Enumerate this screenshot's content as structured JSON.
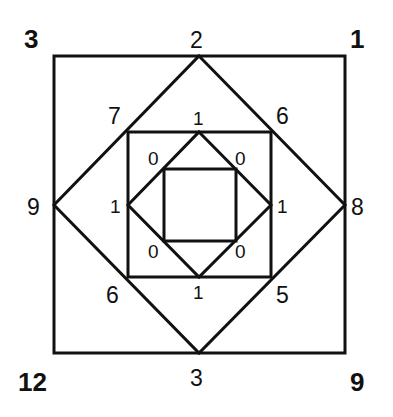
{
  "corner_labels": {
    "top_left": "3",
    "top_right": "1",
    "bottom_left": "12",
    "bottom_right": "9"
  },
  "outer_diamond_labels": {
    "top": "2",
    "right": "8",
    "bottom": "3",
    "left": "9"
  },
  "middle_square_corner_labels": {
    "top_left": "7",
    "top_right": "6",
    "bottom_left": "6",
    "bottom_right": "5"
  },
  "inner_diamond_labels": {
    "top": "1",
    "right": "1",
    "bottom": "1",
    "left": "1"
  },
  "inner_square_corner_labels": {
    "top_left": "0",
    "top_right": "0",
    "bottom_left": "0",
    "bottom_right": "0"
  },
  "colors": {
    "stroke": "#111111",
    "background": "#ffffff"
  }
}
